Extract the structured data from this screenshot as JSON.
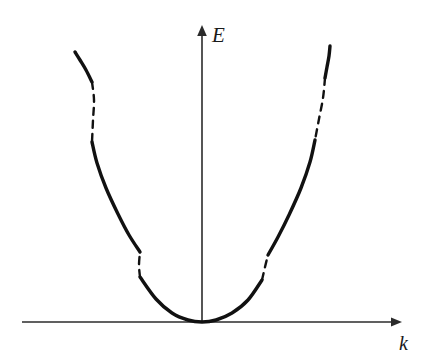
{
  "figure": {
    "background_color": "#ffffff",
    "width": 425,
    "height": 363
  },
  "axes": {
    "vertical": {
      "name": "energy-axis",
      "label": "E",
      "label_x": 212,
      "label_y": 42,
      "x": 202,
      "y_top": 25,
      "y_bottom": 322,
      "color": "#2b2b2b",
      "stroke_width": 1.6,
      "arrow": "up"
    },
    "horizontal": {
      "name": "wavevector-axis",
      "label": "k",
      "label_x": 399,
      "label_y": 350,
      "y": 322,
      "x_left": 22,
      "x_right": 402,
      "color": "#2b2b2b",
      "stroke_width": 1.6,
      "arrow": "right"
    }
  },
  "chart_data": {
    "type": "line",
    "title": "",
    "xlabel": "k",
    "ylabel": "E",
    "grid": false,
    "legend": null,
    "origin_px": [
      202,
      322
    ],
    "curve_color": "#111111",
    "solid_stroke_width": 3.4,
    "dashed_stroke_width": 2.4,
    "dash_pattern": "7,6",
    "series": [
      {
        "name": "band-1-solid",
        "style": "solid",
        "points": [
          [
            140,
            277
          ],
          [
            156,
            299
          ],
          [
            172,
            313
          ],
          [
            188,
            320
          ],
          [
            202,
            322
          ],
          [
            216,
            320
          ],
          [
            232,
            313
          ],
          [
            248,
            300
          ],
          [
            262,
            280
          ]
        ]
      },
      {
        "name": "gap-1-left-dashed",
        "style": "dashed",
        "points": [
          [
            140,
            277
          ],
          [
            139,
            265
          ],
          [
            140,
            252
          ]
        ]
      },
      {
        "name": "gap-1-right-dashed",
        "style": "dashed",
        "points": [
          [
            262,
            280
          ],
          [
            265,
            267
          ],
          [
            268,
            255
          ]
        ]
      },
      {
        "name": "band-2-left-solid",
        "style": "solid",
        "points": [
          [
            92,
            142
          ],
          [
            97,
            163
          ],
          [
            106,
            188
          ],
          [
            118,
            214
          ],
          [
            129,
            235
          ],
          [
            140,
            252
          ]
        ]
      },
      {
        "name": "band-2-right-solid",
        "style": "solid",
        "points": [
          [
            315,
            140
          ],
          [
            310,
            162
          ],
          [
            301,
            188
          ],
          [
            289,
            215
          ],
          [
            278,
            237
          ],
          [
            268,
            255
          ]
        ]
      },
      {
        "name": "gap-2-left-dashed",
        "style": "dashed",
        "points": [
          [
            92,
            82
          ],
          [
            94,
            100
          ],
          [
            93,
            120
          ],
          [
            92,
            142
          ]
        ]
      },
      {
        "name": "gap-2-right-dashed",
        "style": "dashed",
        "points": [
          [
            325,
            78
          ],
          [
            323,
            98
          ],
          [
            319,
            119
          ],
          [
            315,
            140
          ]
        ]
      },
      {
        "name": "band-3-left-solid",
        "style": "solid",
        "points": [
          [
            75,
            52
          ],
          [
            80,
            60
          ],
          [
            86,
            70
          ],
          [
            92,
            82
          ]
        ]
      },
      {
        "name": "band-3-right-solid",
        "style": "solid",
        "points": [
          [
            330,
            46
          ],
          [
            329,
            56
          ],
          [
            327,
            67
          ],
          [
            325,
            78
          ]
        ]
      }
    ],
    "bands": [
      {
        "index": 1,
        "type": "allowed",
        "label": "lowest band (touching origin)"
      },
      {
        "index": 2,
        "type": "allowed",
        "label": "second band"
      },
      {
        "index": 3,
        "type": "allowed",
        "label": "third band (upper fragments)"
      }
    ],
    "gaps": [
      {
        "index": 1,
        "type": "forbidden",
        "side": "left",
        "label": "first band gap, left branch"
      },
      {
        "index": 1,
        "type": "forbidden",
        "side": "right",
        "label": "first band gap, right branch"
      },
      {
        "index": 2,
        "type": "forbidden",
        "side": "left",
        "label": "second band gap, left branch"
      },
      {
        "index": 2,
        "type": "forbidden",
        "side": "right",
        "label": "second band gap, right branch"
      }
    ]
  }
}
